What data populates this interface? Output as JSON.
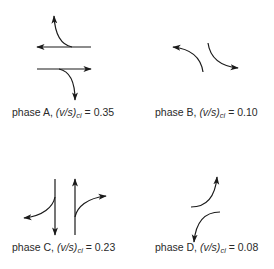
{
  "figure": {
    "phases": [
      {
        "id": "A",
        "label": "phase A,",
        "ratio_symbol": "(v/s)",
        "subscript": "ci",
        "equals": "=",
        "value": "0.35",
        "movements": [
          "westbound through",
          "westbound left (turn north)",
          "eastbound through",
          "eastbound right (turn south)"
        ]
      },
      {
        "id": "B",
        "label": "phase B,",
        "ratio_symbol": "(v/s)",
        "subscript": "ci",
        "equals": "=",
        "value": "0.10",
        "movements": [
          "left turn toward west",
          "left turn toward east"
        ]
      },
      {
        "id": "C",
        "label": "phase C,",
        "ratio_symbol": "(v/s)",
        "subscript": "ci",
        "equals": "=",
        "value": "0.23",
        "movements": [
          "southbound through",
          "southbound right (turn west)",
          "northbound through",
          "northbound right (turn east)"
        ]
      },
      {
        "id": "D",
        "label": "phase D,",
        "ratio_symbol": "(v/s)",
        "subscript": "ci",
        "equals": "=",
        "value": "0.08",
        "movements": [
          "left turn toward north",
          "left turn toward south"
        ]
      }
    ],
    "colors": {
      "stroke": "#1a1a1a",
      "text": "#2a2a2a",
      "background": "#ffffff"
    }
  }
}
